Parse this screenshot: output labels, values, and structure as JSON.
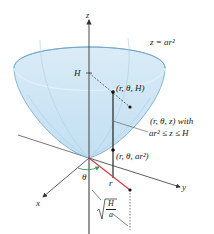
{
  "diagram": {
    "type": "3d-paraboloid-cylindrical-coordinates",
    "colors": {
      "surface_fill": "#cfe6f5",
      "surface_edge": "#6fa6cc",
      "axis": "#333333",
      "radius_segment": "#d0404a",
      "theta_arc": "#3a9a5a",
      "dashed": "#333333"
    },
    "labels": {
      "z_axis": "z",
      "x_axis": "x",
      "y_axis": "y",
      "surface_eq": "z = ar²",
      "height": "H",
      "point_top": "(r, θ, H)",
      "point_mid_line1": "(r, θ, z) with",
      "point_mid_line2": "ar² ≤ z ≤ H",
      "point_bottom": "(r, θ, ar²)",
      "theta": "θ",
      "radius": "r",
      "sqrt_num": "H",
      "sqrt_den": "a"
    }
  }
}
